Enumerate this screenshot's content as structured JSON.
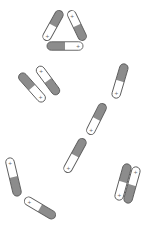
{
  "diagram": {
    "colors": {
      "background": "#ffffff",
      "charged": "#8c8c8c",
      "empty": "#ffffff",
      "outline": "#5a5a5a"
    },
    "battery_width": 8.5,
    "plus_symbol": "+",
    "groups": [
      {
        "name": "triangle",
        "batteries": [
          {
            "x1": 61,
            "y1": 11,
            "x2": 45,
            "y2": 40,
            "plus_end": "end"
          },
          {
            "x1": 70,
            "y1": 11,
            "x2": 84,
            "y2": 40,
            "plus_end": "start"
          },
          {
            "x1": 47,
            "y1": 46,
            "x2": 83,
            "y2": 46,
            "plus_end": "end"
          }
        ]
      },
      {
        "name": "parallel-pair-left",
        "batteries": [
          {
            "x1": 38,
            "y1": 67,
            "x2": 58,
            "y2": 94,
            "plus_end": "start"
          },
          {
            "x1": 20,
            "y1": 74,
            "x2": 44,
            "y2": 101,
            "plus_end": "end"
          }
        ]
      },
      {
        "name": "series-chain",
        "batteries": [
          {
            "x1": 125,
            "y1": 64,
            "x2": 115,
            "y2": 98,
            "plus_end": "end"
          },
          {
            "x1": 104,
            "y1": 104,
            "x2": 89,
            "y2": 134,
            "plus_end": "end"
          },
          {
            "x1": 84,
            "y1": 139,
            "x2": 66,
            "y2": 172,
            "plus_end": "end"
          }
        ]
      },
      {
        "name": "bent-pair",
        "batteries": [
          {
            "x1": 9,
            "y1": 158,
            "x2": 18,
            "y2": 196,
            "plus_end": "start"
          },
          {
            "x1": 25,
            "y1": 199,
            "x2": 55,
            "y2": 217,
            "plus_end": "start"
          }
        ]
      },
      {
        "name": "parallel-pair-right",
        "batteries": [
          {
            "x1": 128,
            "y1": 164,
            "x2": 118,
            "y2": 200,
            "plus_end": "end"
          },
          {
            "x1": 137,
            "y1": 167,
            "x2": 127,
            "y2": 203,
            "plus_end": "start"
          }
        ]
      }
    ]
  }
}
